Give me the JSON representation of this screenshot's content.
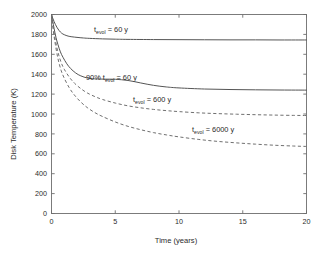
{
  "chart_data": {
    "type": "line",
    "title": "",
    "xlabel": "Time (years)",
    "ylabel": "Disk Temperature (K)",
    "xlim": [
      0,
      20
    ],
    "ylim": [
      0,
      2000
    ],
    "xticks": [
      0,
      5,
      10,
      15,
      20
    ],
    "xtick_labels": [
      "0",
      "5",
      "10",
      "15",
      "20"
    ],
    "yticks": [
      0,
      200,
      400,
      600,
      800,
      1000,
      1200,
      1400,
      1600,
      1800,
      2000
    ],
    "ytick_labels": [
      "0",
      "200",
      "400",
      "600",
      "800",
      "1000",
      "1200",
      "1400",
      "1600",
      "1800",
      "2000"
    ],
    "grid": false,
    "legend_position": "inline-annotations",
    "series": [
      {
        "name": "t_evol = 60 y",
        "style": "solid",
        "color": "#555555",
        "x": [
          0,
          0.1,
          0.2,
          0.3,
          0.45,
          0.6,
          0.8,
          1.0,
          1.3,
          1.6,
          2.0,
          2.5,
          3.0,
          4.0,
          5.0,
          6.0,
          8.0,
          10.0,
          12.0,
          14.0,
          16.0,
          18.0,
          20.0
        ],
        "y": [
          2000,
          1962,
          1930,
          1901,
          1866,
          1838,
          1812,
          1797,
          1783,
          1776,
          1770,
          1764,
          1760,
          1755,
          1752,
          1750,
          1748,
          1747,
          1746,
          1745,
          1745,
          1744,
          1744
        ]
      },
      {
        "name": "90% t_evol = 60 y",
        "style": "solid",
        "color": "#555555",
        "x": [
          0,
          0.1,
          0.2,
          0.35,
          0.5,
          0.7,
          0.9,
          1.2,
          1.5,
          1.9,
          2.3,
          2.8,
          3.2,
          3.6,
          4.2,
          5.0,
          6.0,
          7.0,
          8.0,
          9.0,
          10.0,
          12.0,
          14.0,
          16.0,
          18.0,
          20.0
        ],
        "y": [
          2000,
          1930,
          1862,
          1770,
          1700,
          1624,
          1570,
          1505,
          1457,
          1412,
          1383,
          1362,
          1355,
          1352,
          1350,
          1349,
          1337,
          1312,
          1288,
          1272,
          1262,
          1251,
          1246,
          1243,
          1241,
          1240
        ]
      },
      {
        "name": "t_evol = 600 y",
        "style": "dashed",
        "color": "#707070",
        "x": [
          0,
          0.15,
          0.3,
          0.5,
          0.75,
          1.0,
          1.4,
          1.8,
          2.3,
          2.8,
          3.4,
          4.0,
          5.0,
          6.0,
          7.0,
          8.0,
          9.0,
          10.0,
          11.5,
          13.0,
          14.5,
          16.0,
          17.5,
          19.0,
          20.0
        ],
        "y": [
          2000,
          1860,
          1745,
          1625,
          1520,
          1450,
          1370,
          1310,
          1255,
          1212,
          1175,
          1146,
          1110,
          1082,
          1062,
          1046,
          1034,
          1024,
          1012,
          1004,
          998,
          993,
          989,
          986,
          985
        ]
      },
      {
        "name": "t_evol = 6000 y",
        "style": "dashed",
        "color": "#707070",
        "x": [
          0,
          0.15,
          0.3,
          0.5,
          0.75,
          1.0,
          1.4,
          1.8,
          2.3,
          2.8,
          3.4,
          4.0,
          5.0,
          6.0,
          7.0,
          8.0,
          9.0,
          10.0,
          11.5,
          13.0,
          14.5,
          16.0,
          17.5,
          19.0,
          20.0
        ],
        "y": [
          2000,
          1830,
          1700,
          1560,
          1440,
          1360,
          1262,
          1190,
          1120,
          1065,
          1014,
          975,
          920,
          876,
          842,
          813,
          790,
          770,
          745,
          725,
          710,
          697,
          686,
          678,
          674
        ]
      }
    ],
    "annotations": [
      {
        "id": "ann-tevol-60",
        "text_main": "t",
        "text_sub": "evol",
        "text_tail": " = 60 y",
        "x_px": 94,
        "y_px": 32
      },
      {
        "id": "ann-90pct-tevol-60",
        "text_main": "90% t",
        "text_sub": "evol",
        "text_tail": " = 60 y",
        "x_px": 86,
        "y_px": 80
      },
      {
        "id": "ann-tevol-600",
        "text_main": "t",
        "text_sub": "evol",
        "text_tail": " = 600 y",
        "x_px": 133,
        "y_px": 102
      },
      {
        "id": "ann-tevol-6000",
        "text_main": "t",
        "text_sub": "evol",
        "text_tail": " = 6000 y",
        "x_px": 192,
        "y_px": 132
      }
    ]
  }
}
